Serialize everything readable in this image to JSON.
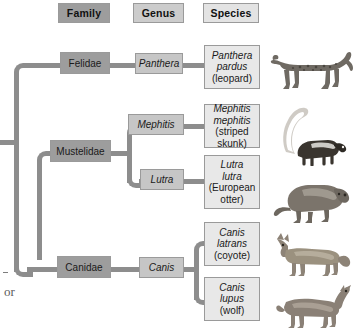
{
  "headers": [
    {
      "id": "family",
      "label": "Family"
    },
    {
      "id": "genus",
      "label": "Genus"
    },
    {
      "id": "species",
      "label": "Species"
    }
  ],
  "families": [
    {
      "id": "felidae",
      "label": "Felidae"
    },
    {
      "id": "mustelidae",
      "label": "Mustelidae"
    },
    {
      "id": "canidae",
      "label": "Canidae"
    }
  ],
  "genera": [
    {
      "id": "panthera",
      "label": "Panthera"
    },
    {
      "id": "mephitis",
      "label": "Mephitis"
    },
    {
      "id": "lutra",
      "label": "Lutra"
    },
    {
      "id": "canis",
      "label": "Canis"
    }
  ],
  "species": [
    {
      "id": "panthera-pardus",
      "binomial_line1": "Panthera",
      "binomial_line2": "pardus",
      "common": "(leopard)",
      "animal": "leopard"
    },
    {
      "id": "mephitis-mephitis",
      "binomial_line1": "Mephitis",
      "binomial_line2": "mephitis",
      "common": "(striped skunk)",
      "animal": "striped-skunk"
    },
    {
      "id": "lutra-lutra",
      "binomial_line1": "Lutra",
      "binomial_line2": "lutra",
      "common": "(European",
      "common2": "otter)",
      "animal": "european-otter"
    },
    {
      "id": "canis-latrans",
      "binomial_line1": "Canis",
      "binomial_line2": "latrans",
      "common": "(coyote)",
      "animal": "coyote"
    },
    {
      "id": "canis-lupus",
      "binomial_line1": "Canis",
      "binomial_line2": "lupus",
      "common": "(wolf)",
      "animal": "wolf"
    }
  ],
  "margin_text": {
    "fragment": "or"
  },
  "colors": {
    "family_fill": "#9d9d9d",
    "genus_fill": "#c6c6c6",
    "species_fill": "#e8e8e8",
    "connector": "#8d8d8d",
    "border": "#9a9a9a"
  }
}
